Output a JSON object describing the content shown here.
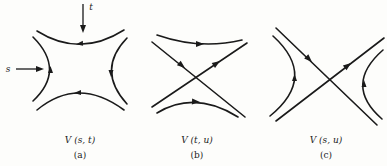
{
  "figure": {
    "panels": [
      {
        "id": "a",
        "caption": "V (s, t)",
        "sublabel": "(a)",
        "incoming_labels": {
          "s": "s",
          "t": "t"
        }
      },
      {
        "id": "b",
        "caption": "V (t, u)",
        "sublabel": "(b)"
      },
      {
        "id": "c",
        "caption": "V (s, u)",
        "sublabel": "(c)"
      }
    ],
    "ink_color": "#1a1a1a",
    "background_color": "#fdfdfb"
  }
}
